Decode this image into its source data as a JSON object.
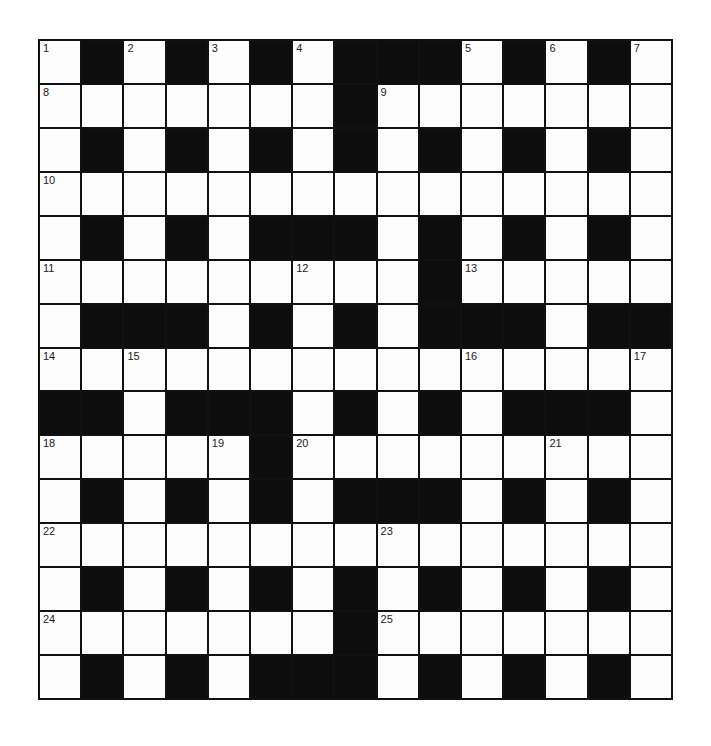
{
  "puzzle": {
    "type": "crossword",
    "rows": 15,
    "cols": 15,
    "colors": {
      "block": "#0d0d0d",
      "cell": "#fdfdfd",
      "line": "#111111",
      "number": "#1a1a1a"
    },
    "layout": [
      "W.W.W.W...W.W.W",
      "WWWWWWW.WWWWWWW",
      "W.W.W.W.W.W.W.W",
      "WWWWWWWWWWWWWWW",
      "W.W.W...W.W.W.W",
      "WWWWWWWWW.WWWWW",
      "W...W.W.W...W..",
      "WWWWWWWWWWWWWWW",
      "..W...W.W.W...W",
      "WWWWW.WWWWWWWWW",
      "W.W.W.W...W.W.W",
      "WWWWWWWWWWWWWWW",
      "W.W.W.W.W.W.W.W",
      "WWWWWWW.WWWWWWW",
      "W.W.W...W.W.W.W"
    ],
    "numbers": [
      {
        "row": 0,
        "col": 0,
        "n": "1"
      },
      {
        "row": 0,
        "col": 2,
        "n": "2"
      },
      {
        "row": 0,
        "col": 4,
        "n": "3"
      },
      {
        "row": 0,
        "col": 6,
        "n": "4"
      },
      {
        "row": 0,
        "col": 10,
        "n": "5"
      },
      {
        "row": 0,
        "col": 12,
        "n": "6"
      },
      {
        "row": 0,
        "col": 14,
        "n": "7"
      },
      {
        "row": 1,
        "col": 0,
        "n": "8"
      },
      {
        "row": 1,
        "col": 8,
        "n": "9"
      },
      {
        "row": 3,
        "col": 0,
        "n": "10"
      },
      {
        "row": 5,
        "col": 0,
        "n": "11"
      },
      {
        "row": 5,
        "col": 6,
        "n": "12"
      },
      {
        "row": 5,
        "col": 10,
        "n": "13"
      },
      {
        "row": 7,
        "col": 0,
        "n": "14"
      },
      {
        "row": 7,
        "col": 2,
        "n": "15"
      },
      {
        "row": 7,
        "col": 10,
        "n": "16"
      },
      {
        "row": 7,
        "col": 14,
        "n": "17"
      },
      {
        "row": 9,
        "col": 0,
        "n": "18"
      },
      {
        "row": 9,
        "col": 4,
        "n": "19"
      },
      {
        "row": 9,
        "col": 6,
        "n": "20"
      },
      {
        "row": 9,
        "col": 12,
        "n": "21"
      },
      {
        "row": 11,
        "col": 0,
        "n": "22"
      },
      {
        "row": 11,
        "col": 8,
        "n": "23"
      },
      {
        "row": 13,
        "col": 0,
        "n": "24"
      },
      {
        "row": 13,
        "col": 8,
        "n": "25"
      }
    ]
  }
}
